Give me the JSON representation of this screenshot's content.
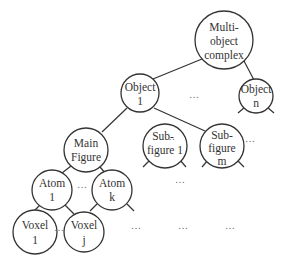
{
  "diagram": {
    "type": "hierarchy-tree",
    "nodes": {
      "root": {
        "line1": "Multi-",
        "line2": "object",
        "line3": "complex"
      },
      "object1": {
        "line1": "Object",
        "line2": "1"
      },
      "objectn": {
        "line1": "Object",
        "line2": "n"
      },
      "mainfigure": {
        "line1": "Main",
        "line2": "Figure"
      },
      "subfigure1": {
        "line1": "Sub-",
        "line2": "figure 1"
      },
      "subfigurem": {
        "line1": "Sub-",
        "line2": "figure",
        "line3": "m"
      },
      "atom1": {
        "line1": "Atom",
        "line2": "1"
      },
      "atomk": {
        "line1": "Atom",
        "line2": "k"
      },
      "voxel1": {
        "line1": "Voxel",
        "line2": "1"
      },
      "voxelj": {
        "line1": "Voxel",
        "line2": "j"
      }
    },
    "ellipsis": "…"
  }
}
